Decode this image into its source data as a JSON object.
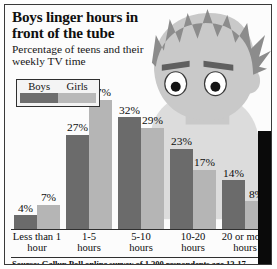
{
  "headline": {
    "title": "Boys linger hours in front of the tube",
    "subtitle": "Percentage of teens and their weekly TV time"
  },
  "legend": {
    "series": [
      {
        "label": "Boys",
        "color": "#6b6b6b"
      },
      {
        "label": "Girls",
        "color": "#b5b5b5"
      }
    ]
  },
  "source": {
    "text": "Source: Gallup Poll online survey of 1,200 respondents age 13-17."
  },
  "illustration": {
    "name": "teen-boy-cartoon",
    "colors": {
      "hair": "#8c8c8c",
      "face": "#c9c9c9",
      "body": "#dcdcdc",
      "eye_white": "#ffffff",
      "pupil": "#141414",
      "brow": "#5f5f5f"
    }
  },
  "chart_data": {
    "type": "bar",
    "title": "Boys linger hours in front of the tube",
    "subtitle": "Percentage of teens and their weekly TV time",
    "xlabel": "",
    "ylabel": "",
    "ylim": [
      0,
      40
    ],
    "grid": false,
    "legend_position": "top-left",
    "categories": [
      "Less than 1 hour",
      "1-5 hours",
      "5-10 hours",
      "10-20 hours",
      "20 or more hours"
    ],
    "series": [
      {
        "name": "Boys",
        "color": "#6b6b6b",
        "values": [
          4,
          27,
          32,
          23,
          14
        ],
        "labels": [
          "4%",
          "27%",
          "32%",
          "23%",
          "14%"
        ]
      },
      {
        "name": "Girls",
        "color": "#b5b5b5",
        "values": [
          7,
          37,
          29,
          17,
          8
        ],
        "labels": [
          "7%",
          "37%",
          "29%",
          "17%",
          "8%"
        ]
      }
    ],
    "source": "Source: Gallup Poll online survey of 1,200 respondents age 13-17."
  }
}
